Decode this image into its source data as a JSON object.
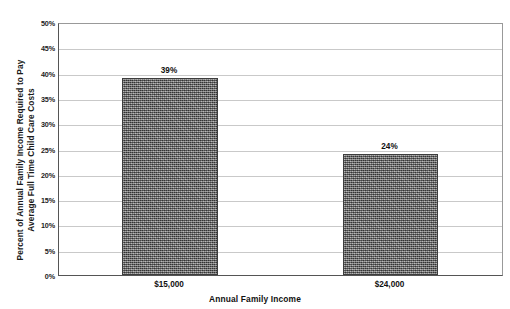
{
  "chart_data": {
    "type": "bar",
    "title": "",
    "categories": [
      "$15,000",
      "$24,000"
    ],
    "values": [
      39,
      24
    ],
    "data_labels": [
      "39%",
      "24%"
    ],
    "xlabel": "Annual Family Income",
    "ylabel_line1": "Percent of Annual Family Income Required to Pay",
    "ylabel_line2": "Average Full Time Child Care Costs",
    "ylim": [
      0,
      50
    ],
    "ytick_values": [
      0,
      5,
      10,
      15,
      20,
      25,
      30,
      35,
      40,
      45,
      50
    ],
    "ytick_labels": [
      "0%",
      "5%",
      "10%",
      "15%",
      "20%",
      "25%",
      "30%",
      "35%",
      "40%",
      "45%",
      "50%"
    ],
    "grid": "horizontal",
    "legend": "none",
    "series_fill": "#6e6e6e",
    "gridline_color": "#c9c9c9",
    "axis_color": "#555555"
  }
}
